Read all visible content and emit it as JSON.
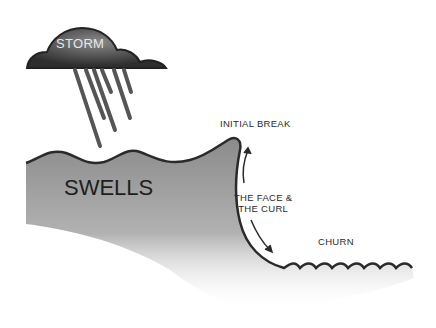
{
  "diagram": {
    "labels": {
      "storm": "STORM",
      "swells": "SWELLS",
      "initial_break": "INITIAL BREAK",
      "face_line1": "THE FACE &",
      "face_line2": "THE CURL",
      "churn": "CHURN"
    },
    "colors": {
      "cloud": "#3a3a3a",
      "water": "#8a8a8a",
      "outline": "#2a2a2a",
      "text": "#2a2a2a"
    }
  }
}
